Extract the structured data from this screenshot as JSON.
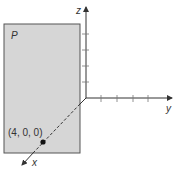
{
  "diagram": {
    "plane_label": "P",
    "point_label": "(4, 0, 0)",
    "axes": {
      "x_label": "x",
      "y_label": "y",
      "z_label": "z"
    },
    "colors": {
      "plane_fill": "#d6d6d6",
      "plane_stroke": "#555555",
      "axis": "#333333"
    },
    "z_tick_count": 4,
    "y_tick_count": 4
  }
}
